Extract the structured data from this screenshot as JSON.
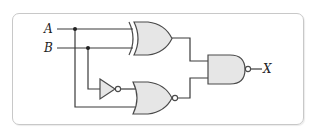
{
  "diagram": {
    "type": "logic-circuit",
    "inputs": [
      {
        "id": "A",
        "label": "A"
      },
      {
        "id": "B",
        "label": "B"
      }
    ],
    "output": {
      "id": "X",
      "label": "X"
    },
    "gates": [
      {
        "id": "g1",
        "type": "XOR",
        "inputs": [
          "A",
          "B"
        ]
      },
      {
        "id": "g2",
        "type": "NOT",
        "inputs": [
          "B"
        ]
      },
      {
        "id": "g3",
        "type": "NOR",
        "inputs": [
          "g2",
          "A"
        ]
      },
      {
        "id": "g4",
        "type": "NAND",
        "inputs": [
          "g1",
          "g3"
        ],
        "output": "X"
      }
    ],
    "colors": {
      "wire": "#3a3a3a",
      "gate_fill": "#e6e6e6",
      "gate_stroke": "#4a4a4a",
      "frame_border": "#c8c8c8"
    }
  }
}
